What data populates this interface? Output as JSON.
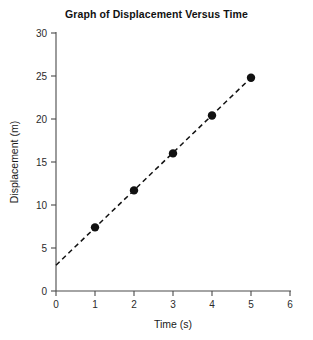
{
  "chart_data": {
    "type": "scatter",
    "title": "Graph of Displacement Versus Time",
    "xlabel": "Time (s)",
    "ylabel": "Displacement (m)",
    "xlim": [
      0,
      6
    ],
    "ylim": [
      0,
      30
    ],
    "xticks": [
      "0",
      "1",
      "2",
      "3",
      "4",
      "5",
      "6"
    ],
    "yticks": [
      "0",
      "5",
      "10",
      "15",
      "20",
      "25",
      "30"
    ],
    "xtick_values": [
      0,
      1,
      2,
      3,
      4,
      5,
      6
    ],
    "ytick_values": [
      0,
      5,
      10,
      15,
      20,
      25,
      30
    ],
    "grid": false,
    "legend": false,
    "series": [
      {
        "name": "Displacement",
        "marker": "filled-circle",
        "color": "#111111",
        "x": [
          1,
          2,
          3,
          4,
          5
        ],
        "values": [
          7.4,
          11.7,
          16.0,
          20.4,
          24.8
        ]
      }
    ],
    "trendline": {
      "style": "dashed",
      "color": "#111111",
      "x_start": 0,
      "y_start": 3.0,
      "x_end": 5,
      "y_end": 24.8
    }
  }
}
